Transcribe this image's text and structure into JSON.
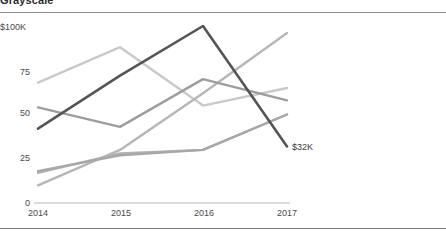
{
  "title": "Grayscale",
  "axis": {
    "y_ticks": [
      "$100K",
      "75",
      "50",
      "25",
      "0"
    ],
    "x_ticks": [
      "2014",
      "2015",
      "2016",
      "2017"
    ]
  },
  "annotation": {
    "end_value_label": "$32K"
  },
  "colors": {
    "axis_line": "#b9b9b9",
    "rule": "#8d8d8d",
    "text": "#3a3a3a",
    "series": [
      "#555555",
      "#c9c9c9",
      "#9d9d9d",
      "#b2b2b2",
      "#b6b6b6",
      "#a8a8a8"
    ]
  },
  "chart_data": {
    "type": "line",
    "title": "Grayscale",
    "xlabel": "",
    "ylabel": "",
    "x": [
      "2014",
      "2015",
      "2016",
      "2017"
    ],
    "ylim": [
      0,
      100
    ],
    "xlim": [
      "2014",
      "2017"
    ],
    "grid": false,
    "legend": "none",
    "y_tick_labels": [
      "0",
      "25",
      "50",
      "75",
      "$100K"
    ],
    "y_tick_values": [
      0,
      25,
      50,
      75,
      100
    ],
    "annotations": [
      {
        "text": "$32K",
        "x": "2017",
        "y": 32,
        "series": "Series 1"
      }
    ],
    "series": [
      {
        "name": "Series 1",
        "color": "#555555",
        "values": [
          42,
          72,
          100,
          32
        ]
      },
      {
        "name": "Series 2",
        "color": "#c9c9c9",
        "values": [
          68,
          88,
          55,
          65
        ]
      },
      {
        "name": "Series 3",
        "color": "#9d9d9d",
        "values": [
          54,
          43,
          70,
          58
        ]
      },
      {
        "name": "Series 4",
        "color": "#b2b2b2",
        "values": [
          17,
          28,
          30,
          50
        ]
      },
      {
        "name": "Series 5",
        "color": "#b6b6b6",
        "values": [
          10,
          30,
          62,
          96
        ]
      },
      {
        "name": "Series 6",
        "color": "#a8a8a8",
        "values": [
          18,
          27,
          30,
          50
        ]
      }
    ]
  }
}
